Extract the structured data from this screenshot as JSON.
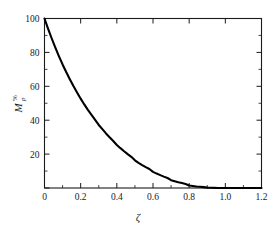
{
  "chart_data": {
    "type": "line",
    "title": "",
    "subtitle": "",
    "xlabel": "ζ",
    "ylabel": "Mp%",
    "ylabel_base": "M",
    "ylabel_subscript": "p",
    "ylabel_superscript": "%",
    "xlim": [
      0,
      1.2
    ],
    "ylim": [
      0,
      100
    ],
    "xticks": [
      0,
      0.2,
      0.4,
      0.6,
      0.8,
      1.0,
      1.2
    ],
    "xticklabels": [
      "0",
      "0.2",
      "0.4",
      "0.6",
      "0.8",
      "1.0",
      "1.2"
    ],
    "yticks": [
      0,
      20,
      40,
      60,
      80,
      100
    ],
    "yticklabels": [
      "",
      "20",
      "40",
      "60",
      "80",
      "100"
    ],
    "x_minor_ticks": [
      0.1,
      0.3,
      0.5,
      0.7,
      0.9,
      1.1
    ],
    "y_minor_ticks": [
      10,
      30,
      50,
      70,
      90
    ],
    "grid": false,
    "legend": null,
    "legend_position": "none",
    "curve_color": "#000000",
    "axis_color": "#1a1a1a",
    "background_color": "#ffffff",
    "annotations": [],
    "series": [
      {
        "name": "percent overshoot",
        "formula": "100*exp(-pi*zeta/sqrt(1-zeta^2))",
        "x": [
          0,
          0.02,
          0.04,
          0.06,
          0.08,
          0.1,
          0.12,
          0.14,
          0.16,
          0.18,
          0.2,
          0.22,
          0.24,
          0.26,
          0.28,
          0.3,
          0.32,
          0.34,
          0.36,
          0.38,
          0.4,
          0.42,
          0.44,
          0.46,
          0.48,
          0.5,
          0.52,
          0.54,
          0.56,
          0.58,
          0.6,
          0.62,
          0.64,
          0.66,
          0.68,
          0.7,
          0.72,
          0.74,
          0.76,
          0.78,
          0.8,
          0.82,
          0.84,
          0.86,
          0.88,
          0.9,
          0.92,
          0.94,
          0.96,
          0.98,
          1.0,
          1.05,
          1.1,
          1.15,
          1.2
        ],
        "values": [
          100,
          93.9,
          88.2,
          82.8,
          77.7,
          72.9,
          68.4,
          64.2,
          60.2,
          56.4,
          52.7,
          49.3,
          46.1,
          43.1,
          40.2,
          37.2,
          34.7,
          32.2,
          29.9,
          27.7,
          25.4,
          23.5,
          21.7,
          20.0,
          18.4,
          16.3,
          14.8,
          13.5,
          12.3,
          11.2,
          9.5,
          8.5,
          7.6,
          6.7,
          5.9,
          4.6,
          4.0,
          3.4,
          2.9,
          2.4,
          1.5,
          1.2,
          0.9,
          0.7,
          0.5,
          0.2,
          0.12,
          0.06,
          0.02,
          0.005,
          0,
          0,
          0,
          0,
          0
        ]
      }
    ]
  }
}
